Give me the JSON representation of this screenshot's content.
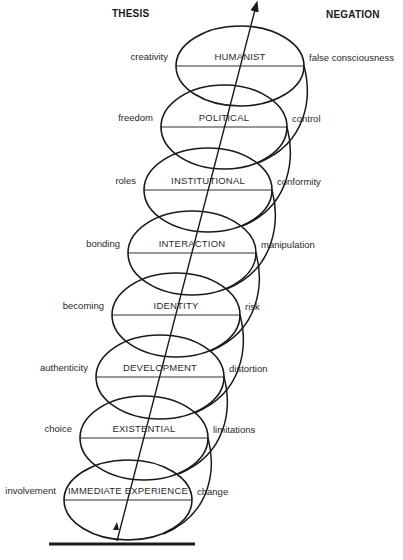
{
  "headers": {
    "thesis": "THESIS",
    "negation": "NEGATION"
  },
  "levels": [
    {
      "name": "HUMANIST",
      "thesis": "creativity",
      "negation": "false consciousness",
      "cx": 240,
      "cy": 66,
      "rx": 64,
      "ry": 40
    },
    {
      "name": "POLITICAL",
      "thesis": "freedom",
      "negation": "control",
      "cx": 224,
      "cy": 127,
      "rx": 63,
      "ry": 42
    },
    {
      "name": "INSTITUTIONAL",
      "thesis": "roles",
      "negation": "conformity",
      "cx": 208,
      "cy": 190,
      "rx": 64,
      "ry": 42
    },
    {
      "name": "INTERACTION",
      "thesis": "bonding",
      "negation": "manipulation",
      "cx": 192,
      "cy": 253,
      "rx": 64,
      "ry": 42
    },
    {
      "name": "IDENTITY",
      "thesis": "becoming",
      "negation": "risk",
      "cx": 176,
      "cy": 315,
      "rx": 64,
      "ry": 42
    },
    {
      "name": "DEVELOPMENT",
      "thesis": "authenticity",
      "negation": "distortion",
      "cx": 160,
      "cy": 377,
      "rx": 64,
      "ry": 42
    },
    {
      "name": "EXISTENTIAL",
      "thesis": "choice",
      "negation": "limitations",
      "cx": 144,
      "cy": 438,
      "rx": 64,
      "ry": 42
    },
    {
      "name": "IMMEDIATE EXPERIENCE",
      "thesis": "involvement",
      "negation": "change",
      "cx": 128,
      "cy": 500,
      "rx": 64,
      "ry": 40
    }
  ],
  "style": {
    "stroke": "#1a1a1a",
    "background": "#ffffff"
  }
}
